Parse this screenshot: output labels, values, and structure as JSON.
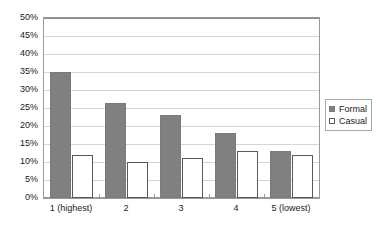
{
  "chart_data": {
    "type": "bar",
    "title": "",
    "subtitle": "",
    "xlabel": "",
    "ylabel": "",
    "categories": [
      "1 (highest)",
      "2",
      "3",
      "4",
      "5 (lowest)"
    ],
    "series": [
      {
        "name": "Formal",
        "color": "#808080",
        "values": [
          35,
          26.5,
          23,
          18,
          13
        ]
      },
      {
        "name": "Casual",
        "color": "#ffffff",
        "values": [
          12,
          10,
          11,
          13,
          12
        ]
      }
    ],
    "ylim": [
      0,
      50
    ],
    "ytick_step": 5,
    "ytick_labels": [
      "0%",
      "5%",
      "10%",
      "15%",
      "20%",
      "25%",
      "30%",
      "35%",
      "40%",
      "45%",
      "50%"
    ],
    "ytick_values": [
      0,
      5,
      10,
      15,
      20,
      25,
      30,
      35,
      40,
      45,
      50
    ],
    "grid": true,
    "grid_axis": "y",
    "legend_position": "right",
    "value_format": "percent"
  }
}
